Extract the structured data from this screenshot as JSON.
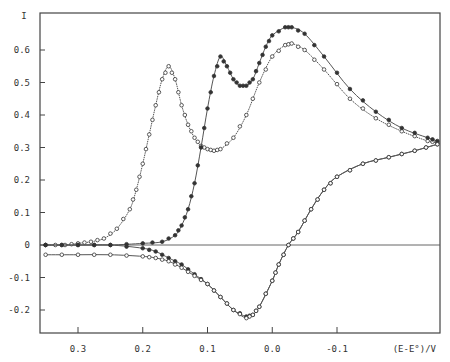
{
  "chart_data": {
    "type": "line",
    "title": "",
    "xlabel": "(E-E°)/V",
    "ylabel": "I",
    "xlim": [
      0.36,
      -0.26
    ],
    "ylim": [
      -0.27,
      0.71
    ],
    "x_ticks": [
      0.3,
      0.2,
      0.1,
      0.0,
      -0.1
    ],
    "x_tick_labels": [
      "0.3",
      "0.2",
      "0.1",
      "0.0",
      "-0.1"
    ],
    "y_ticks": [
      0.6,
      0.5,
      0.4,
      0.3,
      0.2,
      0.1,
      0,
      -0.1,
      -0.2
    ],
    "y_tick_labels": [
      "0.6",
      "0.5",
      "0.4",
      "0.3",
      "0.2",
      "0.1",
      "0",
      "-0.1",
      "-0.2"
    ],
    "zero_line": true,
    "grid": false,
    "legend": null,
    "series": [
      {
        "name": "forward scan A (open circles, early peak)",
        "marker": "open-circle",
        "x": [
          0.35,
          0.32,
          0.3,
          0.28,
          0.26,
          0.24,
          0.22,
          0.21,
          0.2,
          0.19,
          0.18,
          0.17,
          0.16,
          0.15,
          0.14,
          0.13,
          0.12,
          0.11,
          0.1,
          0.09,
          0.08,
          0.06,
          0.04,
          0.02,
          0.0,
          -0.02,
          -0.03,
          -0.05,
          -0.08,
          -0.12,
          -0.16,
          -0.2,
          -0.24,
          -0.255
        ],
        "y": [
          0.0,
          0.0,
          0.005,
          0.01,
          0.02,
          0.05,
          0.11,
          0.17,
          0.25,
          0.34,
          0.43,
          0.51,
          0.55,
          0.51,
          0.43,
          0.37,
          0.33,
          0.305,
          0.295,
          0.29,
          0.295,
          0.33,
          0.4,
          0.5,
          0.58,
          0.615,
          0.62,
          0.6,
          0.54,
          0.45,
          0.39,
          0.35,
          0.32,
          0.315
        ]
      },
      {
        "name": "forward scan B (filled circles, second peak)",
        "marker": "filled-circle",
        "x": [
          0.35,
          0.3,
          0.25,
          0.2,
          0.17,
          0.15,
          0.14,
          0.13,
          0.12,
          0.11,
          0.1,
          0.09,
          0.08,
          0.07,
          0.06,
          0.05,
          0.04,
          0.03,
          0.02,
          0.01,
          0.0,
          -0.02,
          -0.03,
          -0.05,
          -0.08,
          -0.12,
          -0.16,
          -0.2,
          -0.24,
          -0.255
        ],
        "y": [
          0.0,
          0.0,
          0.0,
          0.005,
          0.01,
          0.03,
          0.06,
          0.11,
          0.19,
          0.3,
          0.42,
          0.52,
          0.58,
          0.55,
          0.51,
          0.49,
          0.49,
          0.51,
          0.56,
          0.61,
          0.645,
          0.67,
          0.67,
          0.65,
          0.58,
          0.48,
          0.41,
          0.36,
          0.33,
          0.32
        ]
      },
      {
        "name": "reverse scan (filled circles)",
        "marker": "filled-circle",
        "x": [
          -0.255,
          -0.22,
          -0.18,
          -0.14,
          -0.1,
          -0.08,
          -0.06,
          -0.04,
          -0.025,
          -0.01,
          0.0,
          0.02,
          0.03,
          0.04,
          0.06,
          0.08,
          0.1,
          0.12,
          0.14,
          0.16,
          0.18,
          0.2,
          0.25,
          0.3,
          0.35
        ],
        "y": [
          0.31,
          0.29,
          0.27,
          0.25,
          0.21,
          0.17,
          0.11,
          0.04,
          0.0,
          -0.06,
          -0.11,
          -0.19,
          -0.215,
          -0.22,
          -0.2,
          -0.16,
          -0.12,
          -0.09,
          -0.06,
          -0.04,
          -0.02,
          -0.01,
          0.0,
          0.0,
          0.0
        ]
      },
      {
        "name": "reverse scan baseline (open circles)",
        "marker": "open-circle",
        "x": [
          -0.255,
          -0.22,
          -0.18,
          -0.14,
          -0.1,
          -0.08,
          -0.06,
          -0.04,
          -0.025,
          -0.01,
          0.0,
          0.02,
          0.03,
          0.04,
          0.06,
          0.08,
          0.1,
          0.12,
          0.14,
          0.16,
          0.18,
          0.2,
          0.25,
          0.3,
          0.35
        ],
        "y": [
          0.31,
          0.29,
          0.27,
          0.25,
          0.21,
          0.17,
          0.11,
          0.04,
          0.0,
          -0.06,
          -0.11,
          -0.19,
          -0.215,
          -0.225,
          -0.2,
          -0.16,
          -0.12,
          -0.095,
          -0.07,
          -0.05,
          -0.04,
          -0.035,
          -0.03,
          -0.03,
          -0.03
        ]
      }
    ]
  }
}
